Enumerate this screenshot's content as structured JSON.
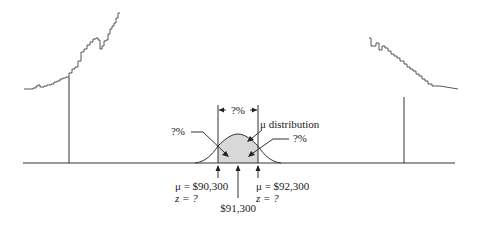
{
  "diagram": {
    "type": "sampling-distribution-illustration",
    "center_label": "$91,300",
    "distribution_label": "μ distribution",
    "width_label": "?%",
    "left_tail_label": "?%",
    "right_tail_label": "?%",
    "left_bound": {
      "mu_label": "μ = $90,300",
      "z_label": "z = ?"
    },
    "right_bound": {
      "mu_label": "μ = $92,300",
      "z_label": "z = ?"
    },
    "colors": {
      "shade": "#d8d8d8",
      "line": "#333333"
    }
  }
}
